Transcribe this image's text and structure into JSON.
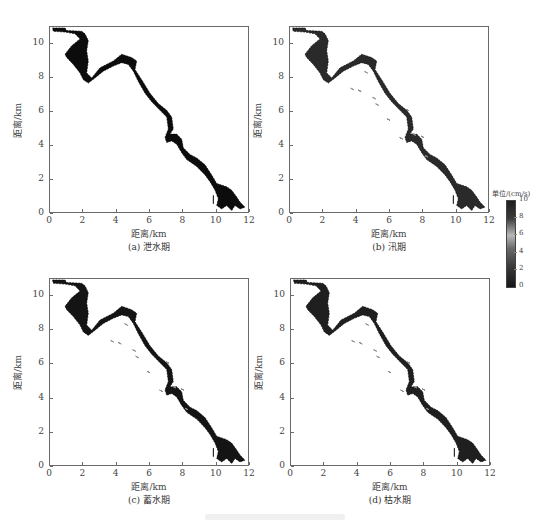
{
  "figure": {
    "colorbar": {
      "title": "单位/(cm/s)",
      "ticks": [
        "10",
        "8",
        "6",
        "4",
        "2",
        "0"
      ],
      "range": [
        0,
        10
      ]
    },
    "panels": [
      {
        "id": "a",
        "caption": "(a) 泄水期",
        "xlabel": "距离/km",
        "ylabel": "距离/km"
      },
      {
        "id": "b",
        "caption": "(b) 汛期",
        "xlabel": "距离/km",
        "ylabel": "距离/km"
      },
      {
        "id": "c",
        "caption": "(c) 蓄水期",
        "xlabel": "距离/km",
        "ylabel": "距离/km"
      },
      {
        "id": "d",
        "caption": "(d) 枯水期",
        "xlabel": "距离/km",
        "ylabel": "距离/km"
      }
    ],
    "x_ticks": [
      "0",
      "2",
      "4",
      "6",
      "8",
      "10",
      "12"
    ],
    "y_ticks": [
      "0",
      "2",
      "4",
      "6",
      "8",
      "10"
    ]
  },
  "chart_data": [
    {
      "type": "heatmap",
      "title": "(a) 泄水期",
      "xlabel": "距离/km",
      "ylabel": "距离/km",
      "xlim": [
        0,
        12
      ],
      "ylim": [
        0,
        11
      ],
      "x_ticks": [
        0,
        2,
        4,
        6,
        8,
        10,
        12
      ],
      "y_ticks": [
        0,
        2,
        4,
        6,
        8,
        10
      ],
      "colorbar": {
        "label": "单位/(cm/s)",
        "range": [
          0,
          10
        ]
      },
      "description": "Flow velocity field over a reservoir reach running from upper-left (~0.2,10.9 km) to lower-right (~11.5,0.3 km); mostly dark (low/high extremes) values."
    },
    {
      "type": "heatmap",
      "title": "(b) 汛期",
      "xlabel": "距离/km",
      "ylabel": "距离/km",
      "xlim": [
        0,
        12
      ],
      "ylim": [
        0,
        11
      ],
      "x_ticks": [
        0,
        2,
        4,
        6,
        8,
        10,
        12
      ],
      "y_ticks": [
        0,
        2,
        4,
        6,
        8,
        10
      ],
      "colorbar": {
        "label": "单位/(cm/s)",
        "range": [
          0,
          10
        ]
      },
      "description": "Flood-season velocity field; more gray-toned mid-range values within the lake bodies."
    },
    {
      "type": "heatmap",
      "title": "(c) 蓄水期",
      "xlabel": "距离/km",
      "ylabel": "距离/km",
      "xlim": [
        0,
        12
      ],
      "ylim": [
        0,
        11
      ],
      "x_ticks": [
        0,
        2,
        4,
        6,
        8,
        10,
        12
      ],
      "y_ticks": [
        0,
        2,
        4,
        6,
        8,
        10
      ],
      "colorbar": {
        "label": "单位/(cm/s)",
        "range": [
          0,
          10
        ]
      },
      "description": "Impoundment-season velocity field with vector-like streaks."
    },
    {
      "type": "heatmap",
      "title": "(d) 枯水期",
      "xlabel": "距离/km",
      "ylabel": "距离/km",
      "xlim": [
        0,
        12
      ],
      "ylim": [
        0,
        11
      ],
      "x_ticks": [
        0,
        2,
        4,
        6,
        8,
        10,
        12
      ],
      "y_ticks": [
        0,
        2,
        4,
        6,
        8,
        10
      ],
      "colorbar": {
        "label": "单位/(cm/s)",
        "range": [
          0,
          10
        ]
      },
      "description": "Dry-season velocity field; dark with scattered gray patches."
    }
  ]
}
